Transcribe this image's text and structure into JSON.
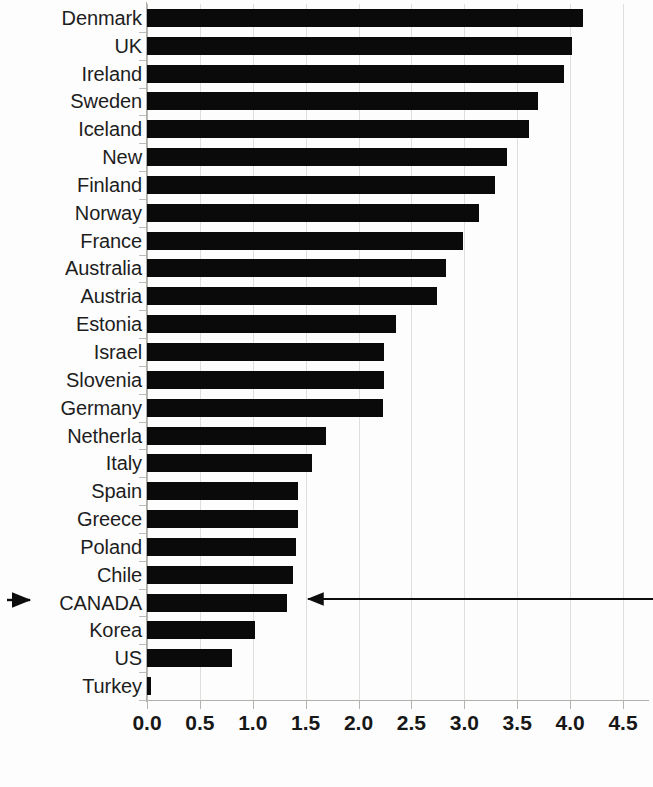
{
  "chart_data": {
    "type": "bar",
    "orientation": "horizontal",
    "title": "",
    "subtitle": "",
    "xlabel": "",
    "ylabel": "",
    "xlim": [
      0.0,
      4.5
    ],
    "ylim": null,
    "grid": true,
    "grid_axis": "x",
    "legend": false,
    "legend_position": "none",
    "bar_color": "#0a0a0a",
    "categories": [
      "Denmark",
      "UK",
      "Ireland",
      "Sweden",
      "Iceland",
      "New",
      "Finland",
      "Norway",
      "France",
      "Australia",
      "Austria",
      "Estonia",
      "Israel",
      "Slovenia",
      "Germany",
      "Netherla",
      "Italy",
      "Spain",
      "Greece",
      "Poland",
      "Chile",
      "CANADA",
      "Korea",
      "US",
      "Turkey"
    ],
    "values": [
      4.12,
      4.02,
      3.94,
      3.7,
      3.61,
      3.4,
      3.29,
      3.14,
      2.99,
      2.83,
      2.74,
      2.35,
      2.24,
      2.24,
      2.23,
      1.69,
      1.56,
      1.43,
      1.43,
      1.41,
      1.38,
      1.32,
      1.02,
      0.8,
      0.04
    ],
    "xticks": [
      0.0,
      0.5,
      1.0,
      1.5,
      2.0,
      2.5,
      3.0,
      3.5,
      4.0,
      4.5
    ],
    "xtick_labels": [
      "0.0",
      "0.5",
      "1.0",
      "1.5",
      "2.0",
      "2.5",
      "3.0",
      "3.5",
      "4.0",
      "4.5"
    ],
    "highlight_category": "CANADA",
    "annotations": [
      {
        "name": "left-pointer-arrow",
        "label": "",
        "target": "CANADA",
        "direction": "right"
      },
      {
        "name": "right-pointer-arrow",
        "label": "",
        "target": "CANADA",
        "direction": "left"
      }
    ]
  }
}
